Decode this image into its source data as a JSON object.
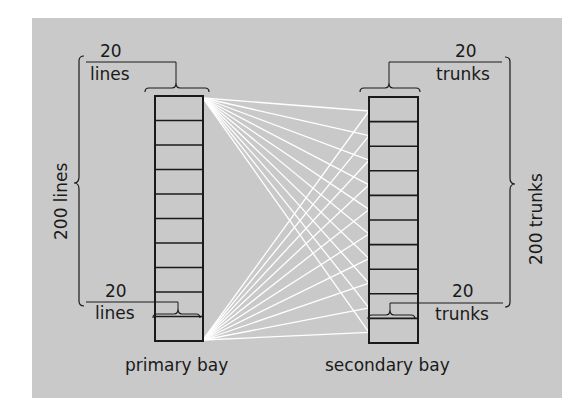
{
  "colors": {
    "panel": "#c9c9c9",
    "ink": "#1a1a1a",
    "wires": "#ffffff",
    "page": "#ffffff"
  },
  "primary_bay": {
    "label": "primary bay",
    "cells": 10,
    "top_group": {
      "count": "20",
      "unit": "lines"
    },
    "bottom_group": {
      "count": "20",
      "unit": "lines"
    },
    "total_label": "200 lines"
  },
  "secondary_bay": {
    "label": "secondary bay",
    "cells": 10,
    "top_group": {
      "count": "20",
      "unit": "trunks"
    },
    "bottom_group": {
      "count": "20",
      "unit": "trunks"
    },
    "total_label": "200 trunks"
  },
  "interconnect": {
    "description": "each 20-line group of primary bay links to every 20-trunk group of secondary bay",
    "links_per_group": 10
  }
}
